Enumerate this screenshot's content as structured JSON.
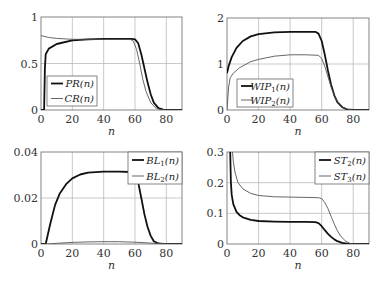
{
  "chart_data": [
    {
      "type": "line",
      "id": "pr-cr",
      "xlabel": "n",
      "ylabel": "",
      "xlim": [
        0,
        90
      ],
      "ylim": [
        0,
        1
      ],
      "xticks": [
        0,
        20,
        40,
        60,
        80
      ],
      "yticks": [
        0,
        0.5,
        1
      ],
      "ytick_labels": [
        "0",
        "0.5",
        "1"
      ],
      "grid": true,
      "legend_position": "lower-left",
      "series": [
        {
          "name": "PR(n)",
          "label_base": "PR",
          "label_sub": "",
          "style": "thick",
          "x": [
            0,
            2,
            2.5,
            3,
            5,
            10,
            20,
            30,
            40,
            50,
            58,
            60,
            62,
            64,
            66,
            68,
            70,
            72,
            75,
            78,
            80,
            90
          ],
          "y": [
            0,
            0,
            0.45,
            0.6,
            0.66,
            0.71,
            0.75,
            0.76,
            0.765,
            0.765,
            0.765,
            0.76,
            0.72,
            0.6,
            0.45,
            0.3,
            0.17,
            0.08,
            0.02,
            0.003,
            0,
            0
          ]
        },
        {
          "name": "CR(n)",
          "label_base": "CR",
          "label_sub": "",
          "style": "thin",
          "x": [
            0,
            5,
            10,
            20,
            30,
            40,
            50,
            57,
            59,
            61,
            63,
            65,
            67,
            70,
            73,
            76,
            80,
            90
          ],
          "y": [
            0.8,
            0.78,
            0.77,
            0.76,
            0.76,
            0.76,
            0.76,
            0.76,
            0.74,
            0.65,
            0.5,
            0.33,
            0.2,
            0.08,
            0.025,
            0.005,
            0,
            0
          ]
        }
      ]
    },
    {
      "type": "line",
      "id": "wip",
      "xlabel": "n",
      "ylabel": "",
      "xlim": [
        0,
        90
      ],
      "ylim": [
        0,
        2
      ],
      "xticks": [
        0,
        20,
        40,
        60,
        80
      ],
      "yticks": [
        0,
        1,
        2
      ],
      "ytick_labels": [
        "0",
        "1",
        "2"
      ],
      "grid": true,
      "legend_position": "lower-left",
      "series": [
        {
          "name": "WIP1(n)",
          "label_base": "WIP",
          "label_sub": "1",
          "style": "thick",
          "x": [
            0,
            1,
            3,
            6,
            10,
            15,
            20,
            30,
            40,
            50,
            56,
            58,
            60,
            62,
            64,
            66,
            68,
            70,
            73,
            76,
            80,
            90
          ],
          "y": [
            0.8,
            0.95,
            1.15,
            1.35,
            1.5,
            1.6,
            1.65,
            1.69,
            1.7,
            1.7,
            1.7,
            1.66,
            1.5,
            1.2,
            0.85,
            0.55,
            0.32,
            0.17,
            0.06,
            0.015,
            0,
            0
          ]
        },
        {
          "name": "WIP2(n)",
          "label_base": "WIP",
          "label_sub": "2",
          "style": "thin",
          "x": [
            0,
            1,
            2,
            4,
            8,
            15,
            20,
            30,
            40,
            50,
            58,
            60,
            62,
            64,
            66,
            68,
            70,
            73,
            76,
            80,
            90
          ],
          "y": [
            0,
            0.5,
            0.7,
            0.8,
            0.92,
            1.05,
            1.1,
            1.17,
            1.2,
            1.2,
            1.19,
            1.12,
            0.95,
            0.72,
            0.5,
            0.32,
            0.18,
            0.07,
            0.02,
            0,
            0
          ]
        }
      ]
    },
    {
      "type": "line",
      "id": "bl",
      "xlabel": "n",
      "ylabel": "",
      "xlim": [
        0,
        90
      ],
      "ylim": [
        0,
        0.04
      ],
      "xticks": [
        0,
        20,
        40,
        60,
        80
      ],
      "yticks": [
        0,
        0.02,
        0.04
      ],
      "ytick_labels": [
        "0",
        "0.02",
        "0.04"
      ],
      "grid": true,
      "legend_position": "upper-right",
      "series": [
        {
          "name": "BL1(n)",
          "label_base": "BL",
          "label_sub": "1",
          "style": "thick",
          "x": [
            0,
            3,
            6,
            9,
            12,
            16,
            20,
            25,
            30,
            40,
            50,
            57,
            60,
            62,
            64,
            66,
            68,
            70,
            72,
            75,
            78,
            90
          ],
          "y": [
            0,
            0,
            0.009,
            0.017,
            0.022,
            0.026,
            0.0285,
            0.0302,
            0.031,
            0.0315,
            0.0315,
            0.0313,
            0.0305,
            0.027,
            0.02,
            0.013,
            0.0075,
            0.0035,
            0.0012,
            0.0002,
            0,
            0
          ]
        },
        {
          "name": "BL2(n)",
          "label_base": "BL",
          "label_sub": "2",
          "style": "thin",
          "x": [
            0,
            4,
            10,
            20,
            30,
            40,
            50,
            60,
            70,
            80,
            90
          ],
          "y": [
            0,
            0,
            0.0003,
            0.0007,
            0.0009,
            0.001,
            0.001,
            0.0008,
            0.0004,
            0.0001,
            0
          ]
        }
      ]
    },
    {
      "type": "line",
      "id": "st",
      "xlabel": "n",
      "ylabel": "",
      "xlim": [
        0,
        90
      ],
      "ylim": [
        0,
        0.3
      ],
      "xticks": [
        0,
        20,
        40,
        60,
        80
      ],
      "yticks": [
        0,
        0.1,
        0.2,
        0.3
      ],
      "ytick_labels": [
        "0",
        "0.1",
        "0.2",
        "0.3"
      ],
      "grid": true,
      "legend_position": "upper-right",
      "series": [
        {
          "name": "ST2(n)",
          "label_base": "ST",
          "label_sub": "2",
          "style": "thick",
          "x": [
            2,
            2.5,
            3,
            4,
            6,
            8,
            10,
            15,
            20,
            30,
            40,
            50,
            56,
            58,
            60,
            62,
            64,
            66,
            68,
            70,
            73,
            76,
            80,
            90
          ],
          "y": [
            0.3,
            0.2,
            0.16,
            0.13,
            0.105,
            0.094,
            0.087,
            0.079,
            0.075,
            0.073,
            0.072,
            0.072,
            0.071,
            0.068,
            0.058,
            0.045,
            0.033,
            0.023,
            0.015,
            0.009,
            0.004,
            0.001,
            0,
            0
          ]
        },
        {
          "name": "ST3(n)",
          "label_base": "ST",
          "label_sub": "3",
          "style": "thin",
          "x": [
            3.5,
            4,
            5,
            7,
            10,
            15,
            20,
            30,
            40,
            50,
            58,
            60,
            62,
            64,
            66,
            68,
            70,
            72,
            75,
            78,
            80,
            90
          ],
          "y": [
            0.3,
            0.27,
            0.235,
            0.2,
            0.18,
            0.165,
            0.158,
            0.154,
            0.153,
            0.152,
            0.151,
            0.148,
            0.135,
            0.115,
            0.09,
            0.065,
            0.043,
            0.026,
            0.01,
            0.002,
            0,
            0
          ]
        }
      ]
    }
  ]
}
